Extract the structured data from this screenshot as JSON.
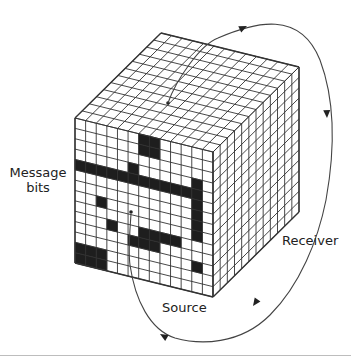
{
  "figure": {
    "labels": {
      "message_line1": "Message",
      "message_line2": "bits",
      "receiver": "Receiver",
      "source": "Source"
    },
    "colors": {
      "line": "#333333",
      "fill_on": "#1e1e1e",
      "fill_off": "#ffffff",
      "rule": "#bdbdbd"
    },
    "cube": {
      "front_top_left": [
        75,
        118
      ],
      "front_top_right": [
        213,
        152
      ],
      "front_height": 145,
      "depth_vector": [
        86,
        -85
      ],
      "columns": 13,
      "rows": 14,
      "depth_cells": 12
    },
    "front_black_cells": [
      [
        6,
        0
      ],
      [
        7,
        0
      ],
      [
        6,
        1
      ],
      [
        7,
        1
      ],
      [
        5,
        3
      ],
      [
        11,
        3
      ],
      [
        0,
        4
      ],
      [
        1,
        4
      ],
      [
        2,
        4
      ],
      [
        3,
        4
      ],
      [
        4,
        4
      ],
      [
        5,
        4
      ],
      [
        6,
        4
      ],
      [
        7,
        4
      ],
      [
        8,
        4
      ],
      [
        9,
        4
      ],
      [
        10,
        4
      ],
      [
        11,
        4
      ],
      [
        11,
        5
      ],
      [
        11,
        6
      ],
      [
        11,
        7
      ],
      [
        11,
        8
      ],
      [
        2,
        7
      ],
      [
        3,
        9
      ],
      [
        6,
        9
      ],
      [
        7,
        9
      ],
      [
        8,
        9
      ],
      [
        9,
        9
      ],
      [
        5,
        10
      ],
      [
        6,
        10
      ],
      [
        7,
        10
      ],
      [
        11,
        11
      ],
      [
        0,
        12
      ],
      [
        1,
        12
      ],
      [
        2,
        12
      ],
      [
        0,
        13
      ],
      [
        1,
        13
      ],
      [
        2,
        13
      ]
    ],
    "arrows": {
      "receiver_cycle": "clockwise arc from top face through right side to bottom, back to source point on front face"
    }
  }
}
